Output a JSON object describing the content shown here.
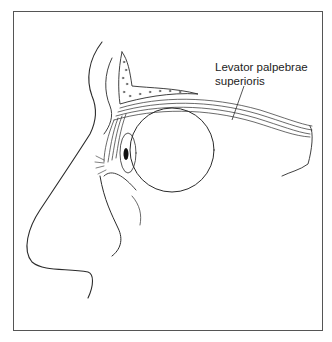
{
  "figure": {
    "labels": [
      {
        "line1": "Levator palpebrae",
        "line2": "superioris"
      }
    ],
    "colors": {
      "line": "#2b2b2b",
      "frame": "#555555",
      "background": "#ffffff"
    }
  }
}
